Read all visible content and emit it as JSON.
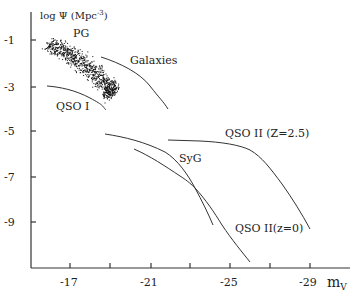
{
  "chart_data": {
    "type": "line",
    "title": "",
    "xlabel": "m_V",
    "ylabel": "log Ψ (Mpc^-3)",
    "xlim": [
      -15.05,
      -31.0
    ],
    "ylim": [
      -11.2,
      0.2
    ],
    "x_ticks": [
      -17,
      -19,
      -21,
      -23,
      -25,
      -27,
      -29
    ],
    "x_tick_labels": [
      "-17",
      "",
      "-21",
      "",
      "-25",
      "",
      "-29"
    ],
    "y_ticks": [
      -1,
      -3,
      -5,
      -7,
      -9
    ],
    "y_tick_labels": [
      "-1",
      "-3",
      "-5",
      "-7",
      "-9"
    ],
    "grid": false,
    "legend": "inline labels",
    "series": [
      {
        "name": "PG",
        "kind": "scatter-cloud",
        "band_center": [
          [
            -15.9,
            -1.1
          ],
          [
            -17.0,
            -1.6
          ],
          [
            -18.0,
            -2.25
          ],
          [
            -18.9,
            -3.0
          ],
          [
            -19.1,
            -3.4
          ]
        ],
        "band_width_logpsi": 0.9
      },
      {
        "name": "Galaxies",
        "kind": "line",
        "x": [
          -18.55,
          -19.3,
          -20.0,
          -20.55,
          -21.0,
          -21.5,
          -21.9
        ],
        "y": [
          -1.75,
          -1.98,
          -2.23,
          -2.6,
          -3.02,
          -3.5,
          -4.03
        ]
      },
      {
        "name": "QSO I",
        "kind": "line",
        "x": [
          -15.85,
          -16.5,
          -17.0,
          -17.5,
          -18.0,
          -18.45,
          -18.8
        ],
        "y": [
          -3.02,
          -3.08,
          -3.2,
          -3.35,
          -3.55,
          -3.8,
          -4.08
        ]
      },
      {
        "name": "QSO II (Z=2.5)",
        "kind": "line",
        "x": [
          -21.9,
          -23.5,
          -24.5,
          -25.5,
          -26.2,
          -26.75,
          -27.4,
          -28.0,
          -28.5,
          -29.0
        ],
        "y": [
          -5.4,
          -5.44,
          -5.52,
          -5.66,
          -5.95,
          -6.36,
          -7.0,
          -7.81,
          -8.55,
          -9.3
        ]
      },
      {
        "name": "SyG",
        "kind": "line",
        "x": [
          -18.75,
          -19.6,
          -20.5,
          -21.2,
          -21.75,
          -22.2,
          -22.5,
          -22.9,
          -23.25,
          -23.7,
          -24.15
        ],
        "y": [
          -5.13,
          -5.27,
          -5.48,
          -5.68,
          -5.92,
          -6.2,
          -6.5,
          -6.95,
          -7.5,
          -8.3,
          -9.13
        ]
      },
      {
        "name": "QSO II (z=0)",
        "kind": "line",
        "x": [
          -20.2,
          -21.0,
          -21.75,
          -22.5,
          -23.25,
          -23.9,
          -24.5,
          -25.2,
          -26.0
        ],
        "y": [
          -5.8,
          -6.2,
          -6.63,
          -7.03,
          -7.5,
          -8.1,
          -9.0,
          -9.8,
          -10.76
        ]
      }
    ],
    "annotations": [
      {
        "text": "PG",
        "x": -17.4,
        "y": -0.85
      },
      {
        "text": "Galaxies",
        "x": -20.0,
        "y": -1.9
      },
      {
        "text": "QSO I",
        "x": -16.3,
        "y": -4.0
      },
      {
        "text": "QSO II (Z=2.5)",
        "x": -25.6,
        "y": -5.1
      },
      {
        "text": "SyG",
        "x": -22.6,
        "y": -6.1
      },
      {
        "text": "QSO II(z=0)",
        "x": -25.6,
        "y": -9.0
      }
    ]
  },
  "labels": {
    "y_axis_title": "log Ψ (Mpc",
    "y_axis_exp": "-3",
    "y_axis_close": ")",
    "x_axis_title_main": "m",
    "x_axis_title_sub": "V",
    "pg": "PG",
    "galaxies": "Galaxies",
    "qso1": "QSO I",
    "qso2_z25": "QSO II (Z=2.5)",
    "syg": "SyG",
    "qso2_z0": "QSO II(z=0)",
    "xt_17": "-17",
    "xt_21": "-21",
    "xt_25": "-25",
    "xt_29": "-29",
    "yt_1": "-1",
    "yt_3": "-3",
    "yt_5": "-5",
    "yt_7": "-7",
    "yt_9": "-9"
  }
}
